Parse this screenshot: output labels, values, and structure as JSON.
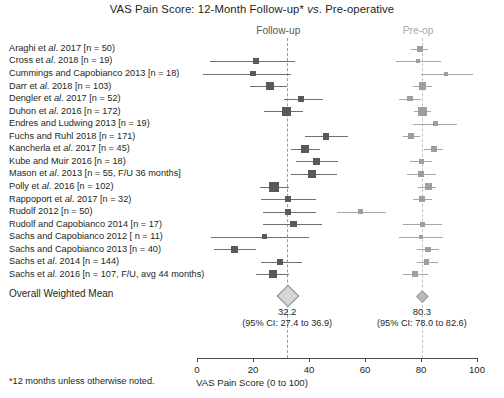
{
  "title": "VAS Pain Score: 12-Month Follow-up* vs. Pre-operative",
  "title_parts": {
    "before": "VAS Pain Score: 12-Month Follow-up* ",
    "italic": "vs",
    "after": ". Pre-operative"
  },
  "headers": {
    "followup": "Follow-up",
    "preop": "Pre-op"
  },
  "overall_label": "Overall Weighted Mean",
  "footnote": "*12 months unless otherwise noted.",
  "colors": {
    "followup_marker": "#595959",
    "preop_marker": "#9e9e9e",
    "followup_ref": "#9a9a9a",
    "preop_ref": "#c4c4c4",
    "diamond_fill": "#d6d6d6",
    "text": "#231f20"
  },
  "chart_data": {
    "type": "forest",
    "title": "VAS Pain Score: 12-Month Follow-up* vs. Pre-operative",
    "xlabel": "VAS Pain Score (0 to 100)",
    "ylabel": "",
    "xlim": [
      0,
      100
    ],
    "xticks": [
      0,
      20,
      40,
      60,
      80,
      100
    ],
    "xticklabels": [
      "0",
      "20",
      "40",
      "60",
      "80",
      "100"
    ],
    "grid": false,
    "legend": "none",
    "reference_lines": [
      {
        "name": "Follow-up",
        "value": 32.2
      },
      {
        "name": "Pre-op",
        "value": 80.3
      }
    ],
    "series": [
      {
        "name": "Follow-up",
        "color": "#595959"
      },
      {
        "name": "Pre-op",
        "color": "#9e9e9e"
      }
    ],
    "rows": [
      {
        "label": "Araghi et al. 2017 [n = 50)",
        "label_plain": "Araghi et al. 2017 [n = 50)",
        "label_pre": "Araghi et ",
        "label_italic": "al",
        "label_post": ". 2017 [n = 50)",
        "n": 50,
        "followup": {
          "mean": null,
          "lo": null,
          "hi": null,
          "size": 0
        },
        "preop": {
          "mean": 79.5,
          "lo": 76.5,
          "hi": 82.5,
          "size": 6
        }
      },
      {
        "label_pre": "Cross et ",
        "label_italic": "al",
        "label_post": ". 2018 [n = 19)",
        "n": 19,
        "followup": {
          "mean": 21.0,
          "lo": 4.5,
          "hi": 35.0,
          "size": 5.5
        },
        "preop": {
          "mean": 79.0,
          "lo": 71.0,
          "hi": 87.0,
          "size": 4.5
        }
      },
      {
        "label_pre": "Cummings and Capobianco 2013 [n = 18)",
        "label_italic": "",
        "label_post": "",
        "n": 18,
        "followup": {
          "mean": 20.0,
          "lo": 2.0,
          "hi": 33.5,
          "size": 5.5
        },
        "preop": {
          "mean": 89.0,
          "lo": 80.0,
          "hi": 98.5,
          "size": 4
        }
      },
      {
        "label_pre": "Darr et ",
        "label_italic": "al",
        "label_post": ". 2018 [n = 103)",
        "n": 103,
        "followup": {
          "mean": 26.0,
          "lo": 19.0,
          "hi": 32.0,
          "size": 8
        },
        "preop": {
          "mean": 80.5,
          "lo": 77.0,
          "hi": 84.0,
          "size": 7.5
        }
      },
      {
        "label_pre": "Dengler et ",
        "label_italic": "al",
        "label_post": ". 2017 [n = 52)",
        "n": 52,
        "followup": {
          "mean": 37.0,
          "lo": 31.0,
          "hi": 45.0,
          "size": 6
        },
        "preop": {
          "mean": 76.0,
          "lo": 72.0,
          "hi": 80.0,
          "size": 5.5
        }
      },
      {
        "label_pre": "Duhon et ",
        "label_italic": "al",
        "label_post": ". 2016 [n = 172)",
        "n": 172,
        "followup": {
          "mean": 32.0,
          "lo": 24.0,
          "hi": 38.0,
          "size": 9
        },
        "preop": {
          "mean": 80.5,
          "lo": 77.5,
          "hi": 83.5,
          "size": 9
        }
      },
      {
        "label_pre": "Endres and Ludwing 2013 [n = 19)",
        "label_italic": "",
        "label_post": "",
        "n": 19,
        "followup": {
          "mean": null,
          "lo": null,
          "hi": null,
          "size": 0
        },
        "preop": {
          "mean": 85.0,
          "lo": 77.0,
          "hi": 93.0,
          "size": 5
        }
      },
      {
        "label_pre": "Fuchs and Ruhl 2018 [n = 171)",
        "label_italic": "",
        "label_post": "",
        "n": 171,
        "followup": {
          "mean": 46.0,
          "lo": 38.5,
          "hi": 54.0,
          "size": 6.5
        },
        "preop": {
          "mean": 76.5,
          "lo": 73.5,
          "hi": 79.5,
          "size": 6
        }
      },
      {
        "label_pre": "Kancherla et ",
        "label_italic": "al",
        "label_post": ". 2017 [n = 45)",
        "n": 45,
        "followup": {
          "mean": 38.5,
          "lo": 33.5,
          "hi": 44.0,
          "size": 8.5
        },
        "preop": {
          "mean": 84.5,
          "lo": 81.0,
          "hi": 88.0,
          "size": 6
        }
      },
      {
        "label_pre": "Kube and Muir 2016 [n = 18)",
        "label_italic": "",
        "label_post": "",
        "n": 18,
        "followup": {
          "mean": 42.5,
          "lo": 35.5,
          "hi": 50.5,
          "size": 7
        },
        "preop": {
          "mean": 80.0,
          "lo": 76.0,
          "hi": 84.0,
          "size": 5
        }
      },
      {
        "label_pre": "Mason et ",
        "label_italic": "al",
        "label_post": ". 2013 [n = 55, F/U 36 months]",
        "n": 55,
        "followup": {
          "mean": 41.0,
          "lo": 33.5,
          "hi": 50.0,
          "size": 7.5
        },
        "preop": {
          "mean": 80.0,
          "lo": 75.0,
          "hi": 85.5,
          "size": 5.5
        }
      },
      {
        "label_pre": "Polly et ",
        "label_italic": "al",
        "label_post": ". 2016 [n = 102)",
        "n": 102,
        "followup": {
          "mean": 27.5,
          "lo": 22.5,
          "hi": 33.0,
          "size": 10
        },
        "preop": {
          "mean": 82.5,
          "lo": 79.0,
          "hi": 85.5,
          "size": 7
        }
      },
      {
        "label_pre": "Rappoport et ",
        "label_italic": "al",
        "label_post": ". 2017 [n = 32)",
        "n": 32,
        "followup": {
          "mean": 32.5,
          "lo": 23.0,
          "hi": 42.5,
          "size": 6
        },
        "preop": {
          "mean": 80.5,
          "lo": 77.0,
          "hi": 84.0,
          "size": 6
        }
      },
      {
        "label_pre": "Rudolf 2012 [n = 50)",
        "label_italic": "",
        "label_post": "",
        "n": 50,
        "followup": {
          "mean": 32.5,
          "lo": 23.5,
          "hi": 42.5,
          "size": 6
        },
        "preop": {
          "mean": 58.5,
          "lo": 50.0,
          "hi": 67.5,
          "size": 5
        }
      },
      {
        "label_pre": "Rudolf and Capobianco 2014 [n = 17)",
        "label_italic": "",
        "label_post": "",
        "n": 17,
        "followup": {
          "mean": 34.5,
          "lo": 23.5,
          "hi": 44.5,
          "size": 6.5
        },
        "preop": {
          "mean": 80.5,
          "lo": 73.5,
          "hi": 87.5,
          "size": 5
        }
      },
      {
        "label_pre": "Sachs and Capobianco 2012 [ n = 11)",
        "label_italic": "",
        "label_post": "",
        "n": 11,
        "followup": {
          "mean": 24.0,
          "lo": 5.0,
          "hi": 40.0,
          "size": 5
        },
        "preop": {
          "mean": 80.0,
          "lo": 72.0,
          "hi": 88.0,
          "size": 3.5
        }
      },
      {
        "label_pre": "Sachs and Capobianco 2013 [n = 40)",
        "label_italic": "",
        "label_post": "",
        "n": 40,
        "followup": {
          "mean": 13.5,
          "lo": 6.0,
          "hi": 21.0,
          "size": 7
        },
        "preop": {
          "mean": 82.5,
          "lo": 78.5,
          "hi": 86.5,
          "size": 5.5
        }
      },
      {
        "label_pre": "Sachs et ",
        "label_italic": "al",
        "label_post": ". 2014 [n = 144)",
        "n": 144,
        "followup": {
          "mean": 29.5,
          "lo": 23.0,
          "hi": 37.5,
          "size": 6
        },
        "preop": {
          "mean": 82.0,
          "lo": 78.5,
          "hi": 86.0,
          "size": 5.5
        }
      },
      {
        "label_pre": "Sachs et ",
        "label_italic": "al",
        "label_post": ". 2016 [n = 107, F/U, avg 44 months)",
        "n": 107,
        "followup": {
          "mean": 27.0,
          "lo": 21.0,
          "hi": 33.0,
          "size": 8
        },
        "preop": {
          "mean": 78.0,
          "lo": 73.5,
          "hi": 82.5,
          "size": 6
        }
      }
    ],
    "summary": {
      "followup": {
        "value": 32.2,
        "value_label": "32.2",
        "ci_low": 27.4,
        "ci_high": 36.9,
        "ci_label": "(95% CI: 27.4 to 36.9)"
      },
      "preop": {
        "value": 80.3,
        "value_label": "80.3",
        "ci_low": 78.0,
        "ci_high": 82.6,
        "ci_label": "(95% CI: 78.0 to 82.6)"
      }
    }
  }
}
